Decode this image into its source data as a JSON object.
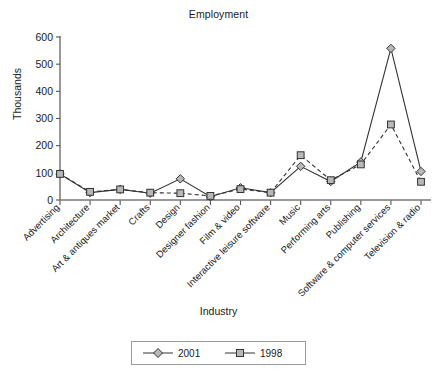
{
  "chart_data": {
    "type": "line",
    "title": "Employment",
    "xlabel": "Industry",
    "ylabel": "Thousands",
    "ylim": [
      0,
      600
    ],
    "yticks": [
      0,
      100,
      200,
      300,
      400,
      500,
      600
    ],
    "grid": false,
    "legend_position": "bottom-center",
    "categories": [
      "Advertising",
      "Architecture",
      "Art & antiques market",
      "Crafts",
      "Design",
      "Designer fashion",
      "Film & video",
      "Interactive leisure software",
      "Music",
      "Performing arts",
      "Publishing",
      "Software & computer services",
      "Television & radio"
    ],
    "series": [
      {
        "name": "2001",
        "marker": "diamond",
        "linestyle": "solid",
        "color": "#333333",
        "values": [
          96,
          27,
          39,
          25,
          78,
          12,
          45,
          27,
          124,
          68,
          140,
          558,
          105
        ]
      },
      {
        "name": "1998",
        "marker": "square",
        "linestyle": "dashed",
        "color": "#333333",
        "values": [
          96,
          30,
          39,
          27,
          25,
          15,
          40,
          27,
          165,
          73,
          131,
          278,
          67
        ]
      }
    ]
  },
  "legend": {
    "entries": [
      {
        "label": "2001"
      },
      {
        "label": "1998"
      }
    ]
  }
}
